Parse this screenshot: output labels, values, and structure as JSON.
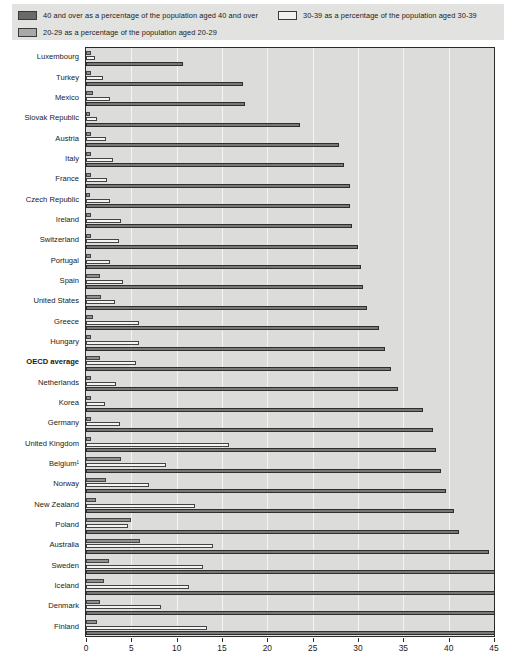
{
  "legend": {
    "items": [
      {
        "key": "b40",
        "label": "40 and over as a percentage of the population aged 40 and over",
        "color": "#6a6a6a",
        "swatch": "sw-dark"
      },
      {
        "key": "b3039",
        "label": "30-39 as a percentage of the population aged 30-39",
        "color": "#f2f2f0",
        "swatch": "sw-white"
      },
      {
        "key": "b2029",
        "label": "20-29 as a percentage of the population aged 20-29",
        "color": "#a8a8a6",
        "swatch": "sw-mid"
      }
    ]
  },
  "chart_data": {
    "type": "bar",
    "orientation": "horizontal",
    "title": "",
    "subtitle": "",
    "xlabel": "",
    "ylabel": "",
    "xlim": [
      0,
      45
    ],
    "xticks": [
      0,
      5,
      10,
      15,
      20,
      25,
      30,
      35,
      40,
      45
    ],
    "grid": true,
    "legend_position": "top",
    "bar_order_top_to_bottom": [
      "20-29",
      "30-39",
      "40 and over"
    ],
    "categories": [
      "Luxembourg",
      "Turkey",
      "Mexico",
      "Slovak Republic",
      "Austria",
      "Italy",
      "France",
      "Czech Republic",
      "Ireland",
      "Switzerland",
      "Portugal",
      "Spain",
      "United States",
      "Greece",
      "Hungary",
      "OECD average",
      "Netherlands",
      "Korea",
      "Germany",
      "United Kingdom",
      "Belgium¹",
      "Norway",
      "New Zealand",
      "Poland",
      "Australia",
      "Sweden",
      "Iceland",
      "Denmark",
      "Finland"
    ],
    "bold_categories": [
      "OECD average"
    ],
    "series": [
      {
        "name": "20-29 as a percentage of the population aged 20-29",
        "key": "b2029",
        "values": [
          0.6,
          0.5,
          0.8,
          0.4,
          0.6,
          0.5,
          0.6,
          0.4,
          0.5,
          0.5,
          0.5,
          1.5,
          1.6,
          0.8,
          0.5,
          1.5,
          0.5,
          0.6,
          0.6,
          0.5,
          3.9,
          2.2,
          1.1,
          5.0,
          6.0,
          2.5,
          2.0,
          1.5,
          1.2
        ]
      },
      {
        "name": "30-39 as a percentage of the population aged 30-39",
        "key": "b3039",
        "values": [
          1.0,
          1.9,
          2.7,
          1.2,
          2.2,
          3.0,
          2.3,
          2.7,
          3.9,
          3.6,
          2.7,
          4.1,
          3.2,
          5.8,
          5.8,
          5.5,
          3.3,
          2.1,
          3.7,
          15.8,
          8.8,
          6.9,
          12.0,
          4.6,
          14.0,
          12.9,
          11.4,
          8.3,
          13.4
        ]
      },
      {
        "name": "40 and over as a percentage of the population aged 40 and over",
        "key": "b40",
        "values": [
          10.7,
          17.3,
          17.5,
          23.6,
          27.9,
          28.5,
          29.1,
          29.1,
          29.3,
          30.0,
          30.3,
          30.5,
          31.0,
          32.3,
          33.0,
          33.6,
          34.4,
          37.2,
          38.3,
          38.6,
          39.2,
          39.7,
          40.6,
          41.1,
          44.4,
          48.4,
          49.9,
          50.2,
          56.6
        ]
      }
    ],
    "note": "Values shown are percentage positions along the 0-45 axis"
  }
}
